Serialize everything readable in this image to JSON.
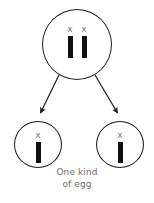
{
  "diagram": {
    "title": "One kind of egg",
    "type": "meiosis-gamete-diagram",
    "colors": {
      "cell_outline": "#1a1a1a",
      "chromosome": "#111111",
      "label_text": "#555555",
      "caption_text": "#6b6b6b",
      "arrow": "#1a1a1a",
      "background": "#ffffff"
    },
    "parent_cell": {
      "name": "parent-cell",
      "chromosomes": [
        {
          "label": "X"
        },
        {
          "label": "X"
        }
      ]
    },
    "arrows": [
      {
        "name": "arrow-to-left-egg",
        "direction": "down-left"
      },
      {
        "name": "arrow-to-right-egg",
        "direction": "down-right"
      }
    ],
    "egg_cells": [
      {
        "name": "egg-cell-left",
        "chromosomes": [
          {
            "label": "X"
          }
        ]
      },
      {
        "name": "egg-cell-right",
        "chromosomes": [
          {
            "label": "X"
          }
        ]
      }
    ],
    "caption": {
      "line1": "One kind",
      "line2": "of egg"
    }
  }
}
